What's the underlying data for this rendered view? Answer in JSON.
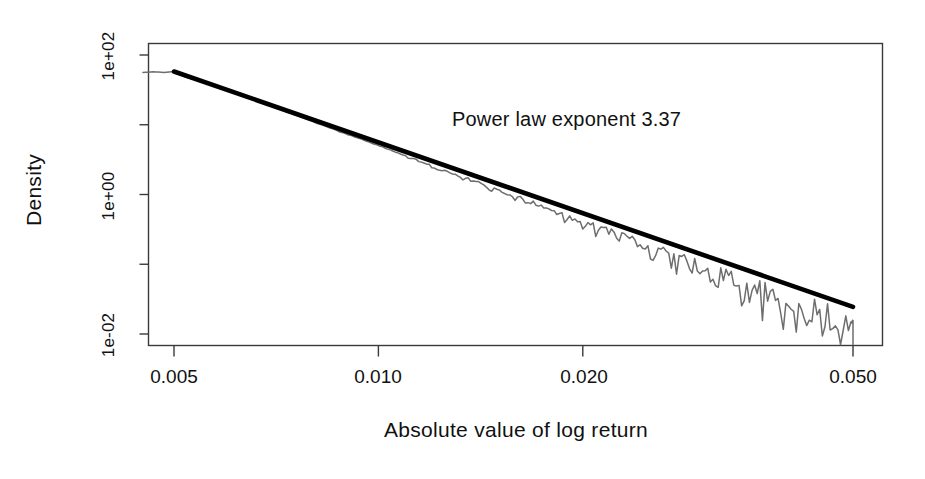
{
  "chart_data": {
    "type": "line",
    "title": "",
    "xlabel": "Absolute value of log return",
    "ylabel": "Density",
    "xscale": "log",
    "yscale": "log",
    "xlim": [
      0.0043,
      0.056
    ],
    "ylim": [
      0.0025,
      560
    ],
    "grid": false,
    "legend": null,
    "xticks": [
      {
        "value": 0.005,
        "label": "0.005"
      },
      {
        "value": 0.01,
        "label": "0.010"
      },
      {
        "value": 0.02,
        "label": "0.020"
      },
      {
        "value": 0.05,
        "label": "0.050"
      }
    ],
    "yticks": [
      {
        "value": 100,
        "label": "1e+02"
      },
      {
        "value": 10,
        "label": ""
      },
      {
        "value": 1,
        "label": "1e+00"
      },
      {
        "value": 0.1,
        "label": ""
      },
      {
        "value": 0.01,
        "label": "1e-02"
      }
    ],
    "annotations": [
      {
        "text": "Power law exponent 3.37",
        "x": 0.0165,
        "y": 12.0
      }
    ],
    "series": [
      {
        "name": "empirical density",
        "type": "line",
        "style": "noisy-stepped",
        "color": "#6e6e6e",
        "x": [
          0.0045,
          0.00466,
          0.00483,
          0.005,
          0.00518,
          0.00537,
          0.00556,
          0.00576,
          0.00597,
          0.00618,
          0.0064,
          0.00663,
          0.00687,
          0.00712,
          0.00737,
          0.00764,
          0.00791,
          0.0082,
          0.00849,
          0.0088,
          0.00911,
          0.00944,
          0.00978,
          0.01013,
          0.0105,
          0.01087,
          0.01126,
          0.01167,
          0.01209,
          0.01252,
          0.01297,
          0.01344,
          0.01392,
          0.01442,
          0.01494,
          0.01548,
          0.01603,
          0.01661,
          0.01721,
          0.01783,
          0.01847,
          0.01913,
          0.01982,
          0.02053,
          0.02127,
          0.02204,
          0.02283,
          0.02365,
          0.0245,
          0.02538,
          0.02629,
          0.02724,
          0.02822,
          0.02923,
          0.03028,
          0.03137,
          0.0325,
          0.03367,
          0.03488,
          0.03613,
          0.03743,
          0.03878,
          0.04017,
          0.04161,
          0.04311,
          0.04466,
          0.04627,
          0.04793,
          0.04966,
          0.05
        ],
        "y": [
          56.0,
          57.5,
          56.2,
          58.0,
          49.0,
          44.0,
          40.0,
          36.0,
          32.0,
          28.5,
          25.0,
          22.0,
          19.4,
          17.2,
          15.0,
          13.2,
          11.6,
          10.2,
          9.0,
          7.9,
          7.0,
          6.2,
          5.4,
          4.8,
          4.2,
          3.7,
          3.25,
          2.85,
          2.52,
          2.22,
          1.95,
          1.72,
          1.52,
          1.33,
          1.17,
          1.03,
          0.91,
          0.8,
          0.7,
          0.61,
          0.54,
          0.47,
          0.41,
          0.36,
          0.32,
          0.28,
          0.245,
          0.215,
          0.188,
          0.164,
          0.144,
          0.126,
          0.11,
          0.096,
          0.084,
          0.073,
          0.064,
          0.056,
          0.049,
          0.043,
          0.038,
          0.033,
          0.029,
          0.025,
          0.022,
          0.019,
          0.0167,
          0.0146,
          0.0128,
          0.012
        ]
      },
      {
        "name": "power law fit",
        "type": "line",
        "style": "straight-thick",
        "color": "#000000",
        "exponent": 3.37,
        "x": [
          0.005,
          0.05
        ],
        "y": [
          58.0,
          0.0245
        ]
      }
    ]
  },
  "axes": {
    "ylabel_text": "Density",
    "xlabel_text": "Absolute value of log return"
  },
  "annotation": {
    "text": "Power law exponent 3.37"
  },
  "ytick_labels": {
    "t0": "1e+02",
    "t1": "1e+00",
    "t2": "1e-02"
  },
  "xtick_labels": {
    "t0": "0.005",
    "t1": "0.010",
    "t2": "0.020",
    "t3": "0.050"
  },
  "colors": {
    "data": "#6e6e6e",
    "fit": "#000000",
    "axis": "#3a3a3a",
    "text": "#111111"
  }
}
